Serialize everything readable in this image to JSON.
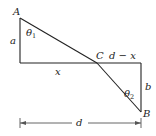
{
  "diagram": {
    "points": {
      "A": {
        "label": "A"
      },
      "B": {
        "label": "B"
      },
      "C": {
        "label": "C"
      }
    },
    "lengths": {
      "a": "a",
      "b": "b",
      "x": "x",
      "d_minus_x": "d − x",
      "d": "d"
    },
    "angles": {
      "theta1": {
        "symbol": "θ",
        "sub": "1"
      },
      "theta2": {
        "symbol": "θ",
        "sub": "2"
      }
    },
    "colors": {
      "line": "#222222",
      "dimension": "#555555",
      "background": "#ffffff"
    }
  }
}
